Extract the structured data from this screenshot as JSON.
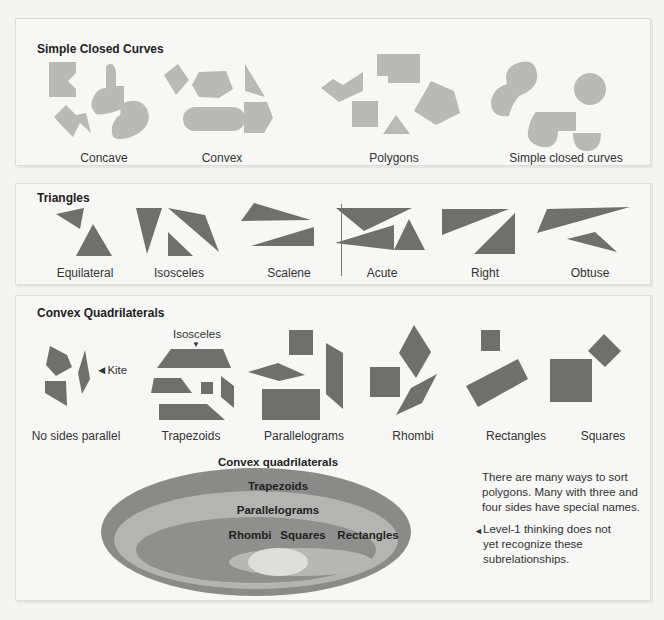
{
  "panels": {
    "simple_closed_curves": {
      "title": "Simple Closed Curves",
      "groups": [
        {
          "label": "Concave"
        },
        {
          "label": "Convex"
        },
        {
          "label": "Polygons"
        },
        {
          "label": "Simple closed curves"
        }
      ]
    },
    "triangles": {
      "title": "Triangles",
      "groups": [
        {
          "label": "Equilateral"
        },
        {
          "label": "Isosceles"
        },
        {
          "label": "Scalene"
        },
        {
          "label": "Acute"
        },
        {
          "label": "Right"
        },
        {
          "label": "Obtuse"
        }
      ]
    },
    "convex_quadrilaterals": {
      "title": "Convex Quadrilaterals",
      "groups": [
        {
          "label": "No sides parallel"
        },
        {
          "label": "Trapezoids"
        },
        {
          "label": "Parallelograms"
        },
        {
          "label": "Rhombi"
        },
        {
          "label": "Rectangles"
        },
        {
          "label": "Squares"
        }
      ],
      "annotations": {
        "kite": "◄Kite",
        "isosceles": "Isosceles",
        "isosceles_marker": "▼"
      },
      "hierarchy": {
        "outer": "Convex quadrilaterals",
        "level2": "Trapezoids",
        "level3": "Parallelograms",
        "left": "Rhombi",
        "center": "Squares",
        "right": "Rectangles"
      },
      "notes": {
        "note1": "There are many ways to sort polygons. Many with three and four sides have special names.",
        "note2_marker": "◄",
        "note2": "Level-1 thinking does not yet recognize these subrelationships."
      }
    }
  },
  "colors": {
    "background": "#f4f4f2",
    "shape_light": "#b9b9b7",
    "shape_dark": "#6f6f6d",
    "ellipse_outer": "#8a8a88",
    "ellipse_level2": "#b4b4b2",
    "ellipse_level3": "#8f8f8d",
    "ellipse_rect": "#b7b7b5",
    "ellipse_square": "#dededc"
  }
}
